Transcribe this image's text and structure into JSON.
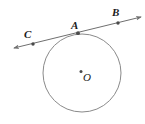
{
  "figure": {
    "kind": "circle-with-secant-line",
    "width": 145,
    "height": 124,
    "background_color": "#ffffff",
    "stroke_color": "#6f6f6f",
    "point_color": "#4a4a4a",
    "label_color": "#1a1a1a"
  },
  "labels": {
    "C": "C",
    "A": "A",
    "B": "B",
    "O": "O"
  },
  "geometry": {
    "circle": {
      "cx": 82,
      "cy": 73,
      "r": 39
    },
    "line": {
      "x1": 14,
      "y1": 48,
      "x2": 141,
      "y2": 17,
      "arrow_start": true,
      "arrow_end": true
    },
    "points": [
      {
        "name": "C",
        "x": 33,
        "y": 44
      },
      {
        "name": "A",
        "x": 78,
        "y": 33
      },
      {
        "name": "B",
        "x": 118,
        "y": 23
      },
      {
        "name": "O",
        "x": 81,
        "y": 71
      }
    ]
  }
}
